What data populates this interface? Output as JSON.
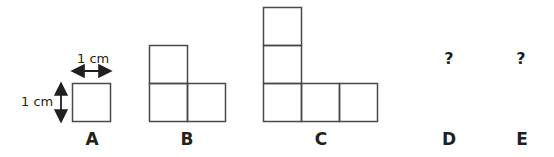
{
  "figures": [
    {
      "label": "A",
      "cells": 1,
      "shape": "single square"
    },
    {
      "label": "B",
      "cells": 3,
      "shape": "L-shape, 2 tall x 2 wide"
    },
    {
      "label": "C",
      "cells": 5,
      "shape": "L-shape, 3 tall x 3 wide"
    },
    {
      "label": "D",
      "unknown": "?"
    },
    {
      "label": "E",
      "unknown": "?"
    }
  ],
  "dimensions": {
    "width_label": "1 cm",
    "height_label": "1 cm"
  },
  "colors": {
    "stroke": "#4a4a4a",
    "text": "#231f20"
  }
}
